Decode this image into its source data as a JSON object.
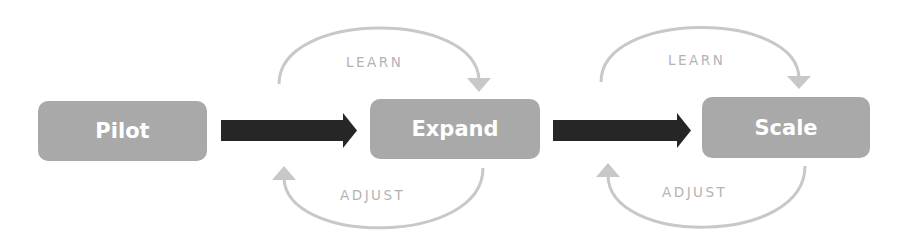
{
  "stages": [
    {
      "label": "Pilot"
    },
    {
      "label": "Expand"
    },
    {
      "label": "Scale"
    }
  ],
  "loops": [
    {
      "top_label": "LEARN",
      "bottom_label": "ADJUST"
    },
    {
      "top_label": "LEARN",
      "bottom_label": "ADJUST"
    }
  ],
  "colors": {
    "box": "#a9a9a9",
    "box_text": "#ffffff",
    "arrow": "#262626",
    "loop": "#c8c8c8",
    "loop_text": "#b3b3b3"
  }
}
